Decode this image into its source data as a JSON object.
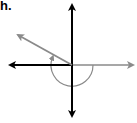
{
  "problem": {
    "label": "h."
  },
  "diagram": {
    "type": "angle-on-axes",
    "origin": [
      72,
      65
    ],
    "axes": {
      "color": "#000000",
      "x_negative_end": [
        8,
        65
      ],
      "y_positive_end": [
        72,
        3
      ],
      "y_negative_end": [
        72,
        118
      ]
    },
    "initial_side": {
      "color": "#8a8a8a",
      "end": [
        135,
        65
      ]
    },
    "terminal_side": {
      "color": "#8a8a8a",
      "end": [
        15,
        34
      ]
    },
    "rotation_arc": {
      "color": "#8a8a8a",
      "radius": 21,
      "direction": "clockwise"
    }
  }
}
